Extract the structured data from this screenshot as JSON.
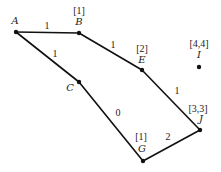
{
  "diagram": {
    "type": "weighted-graph",
    "nodes": [
      {
        "id": "A",
        "label": "A",
        "attr": "",
        "x": 16,
        "y": 32,
        "lx": 15,
        "ly": 24,
        "ax": 0,
        "ay": 0
      },
      {
        "id": "B",
        "label": "B",
        "attr": "[1]",
        "x": 79,
        "y": 33,
        "lx": 79,
        "ly": 25,
        "ax": 79,
        "ay": 14
      },
      {
        "id": "C",
        "label": "C",
        "attr": "",
        "x": 79,
        "y": 82,
        "lx": 70,
        "ly": 91,
        "ax": 0,
        "ay": 0
      },
      {
        "id": "E",
        "label": "E",
        "attr": "[2]",
        "x": 142,
        "y": 70,
        "lx": 142,
        "ly": 63,
        "ax": 142,
        "ay": 52
      },
      {
        "id": "I",
        "label": "I",
        "attr": "[4,4]",
        "x": 199,
        "y": 67,
        "lx": 199,
        "ly": 58,
        "ax": 199,
        "ay": 47
      },
      {
        "id": "J",
        "label": "J",
        "attr": "[3,3]",
        "x": 200,
        "y": 130,
        "lx": 201,
        "ly": 122,
        "ax": 198,
        "ay": 112
      },
      {
        "id": "G",
        "label": "G",
        "attr": "[1]",
        "x": 143,
        "y": 161,
        "lx": 142,
        "ly": 152,
        "ax": 141,
        "ay": 140
      }
    ],
    "edges": [
      {
        "from": "A",
        "to": "B",
        "weight": "1",
        "wx": 47,
        "wy": 29
      },
      {
        "from": "A",
        "to": "C",
        "weight": "1",
        "wx": 55,
        "wy": 57
      },
      {
        "from": "B",
        "to": "E",
        "weight": "1",
        "wx": 113,
        "wy": 48
      },
      {
        "from": "C",
        "to": "G",
        "weight": "0",
        "wx": 118,
        "wy": 116
      },
      {
        "from": "E",
        "to": "J",
        "weight": "1",
        "wx": 177,
        "wy": 94
      },
      {
        "from": "G",
        "to": "J",
        "weight": "2",
        "wx": 168,
        "wy": 140
      }
    ]
  }
}
